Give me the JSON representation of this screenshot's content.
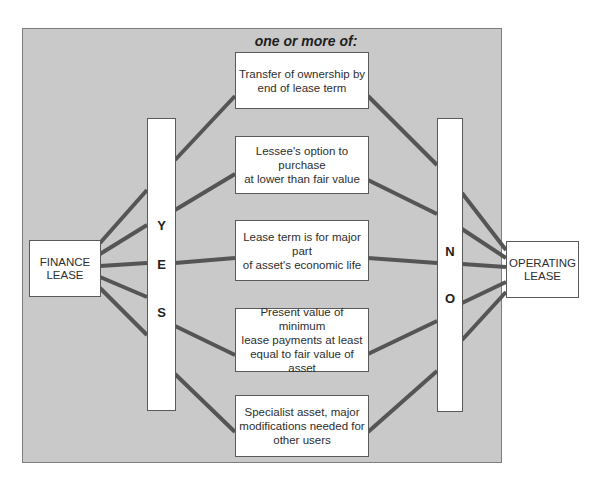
{
  "diagram": {
    "heading": "one or more of:",
    "left_node": {
      "line1": "FINANCE",
      "line2": "LEASE"
    },
    "right_node": {
      "line1": "OPERATING",
      "line2": "LEASE"
    },
    "yes_bar": {
      "letters": [
        "Y",
        "E",
        "S"
      ]
    },
    "no_bar": {
      "letters": [
        "N",
        "O"
      ]
    },
    "criteria": [
      {
        "lines": [
          "Transfer of ownership by",
          "end of lease term"
        ]
      },
      {
        "lines": [
          "Lessee's option to purchase",
          "at lower than fair value"
        ]
      },
      {
        "lines": [
          "Lease term is for major part",
          "of asset's economic life"
        ]
      },
      {
        "lines": [
          "Present value of minimum",
          "lease payments at least",
          "equal to fair value of asset"
        ]
      },
      {
        "lines": [
          "Specialist asset, major",
          "modifications needed for",
          "other users"
        ]
      }
    ],
    "colors": {
      "panel_background": "#c9c9c9",
      "connector": "#555555",
      "box_fill": "#ffffff"
    }
  }
}
